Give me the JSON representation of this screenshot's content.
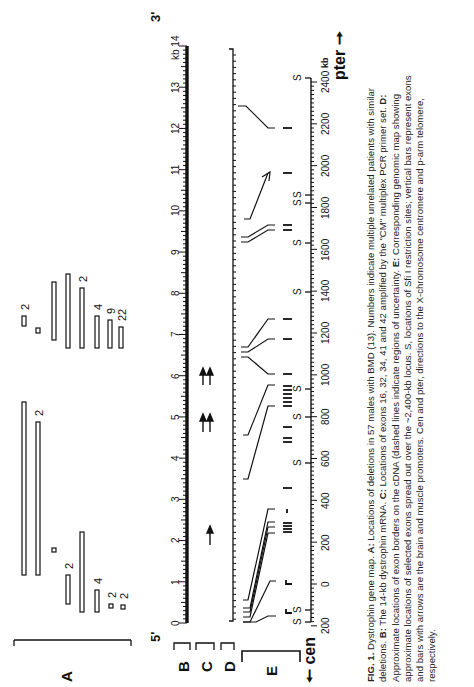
{
  "figure": {
    "label": "FIG. 1.",
    "title": "Dystrophin gene map.",
    "panels": {
      "A": "A",
      "B": "B",
      "C": "C",
      "D": "D",
      "E": "E"
    },
    "five_prime": "5'",
    "three_prime": "3'",
    "kb_unit": "kb",
    "cen_label": "cen",
    "pter_label": "pter",
    "caption_parts": [
      {
        "bold": true,
        "text": "FIG. 1."
      },
      {
        "bold": false,
        "text": " Dystrophin gene map. "
      },
      {
        "bold": true,
        "text": "A:"
      },
      {
        "bold": false,
        "text": " Locations of deletions in 57 males with BMD (13). Numbers indicate multiple unrelated patients with similar deletions. "
      },
      {
        "bold": true,
        "text": "B:"
      },
      {
        "bold": false,
        "text": " The 14-kb dystrophin mRNA. "
      },
      {
        "bold": true,
        "text": "C:"
      },
      {
        "bold": false,
        "text": " Locations of exons 16, 32, 34, 41 and 42 amplified by the \"CM\" multiplex PCR primer set. "
      },
      {
        "bold": true,
        "text": "D:"
      },
      {
        "bold": false,
        "text": " Approximate locations of exon borders on the cDNA (dashed lines indicate regions of uncertainty. "
      },
      {
        "bold": true,
        "text": "E:"
      },
      {
        "bold": false,
        "text": " Corresponding genomic map showing approximate locations of selected exons spread out over the ~2,400-kb locus. S, locations of Sfi I restriction sites; vertical bars represent exons and bars with arrows are the brain and muscle promoters. Cen and pter, directions to the X-chromosome centromere and p-arm telomere, respectively."
      }
    ]
  },
  "chart_data": [
    {
      "type": "table",
      "title": "A: Locations of deletions in 57 males with BMD (cDNA kb coordinates, approx.)",
      "xlabel": "kb",
      "xlim": [
        0,
        14
      ],
      "deletions": [
        {
          "start": 1.2,
          "end": 5.3,
          "count": null
        },
        {
          "start": 1.2,
          "end": 4.8,
          "count": 2
        },
        {
          "start": 2.1,
          "end": 2.2,
          "count": null
        },
        {
          "start": 0.5,
          "end": 1.2,
          "count": 2
        },
        {
          "start": 0.3,
          "end": 2.2,
          "count": null
        },
        {
          "start": 0.3,
          "end": 0.9,
          "count": 4
        },
        {
          "start": 0.3,
          "end": 0.4,
          "count": 2
        },
        {
          "start": 0.3,
          "end": 0.4,
          "count": 2
        },
        {
          "start": 7.2,
          "end": 7.4,
          "count": 2
        },
        {
          "start": 7.0,
          "end": 7.1,
          "count": null
        },
        {
          "start": 6.8,
          "end": 8.3,
          "count": null
        },
        {
          "start": 6.7,
          "end": 8.5,
          "count": null
        },
        {
          "start": 6.7,
          "end": 8.1,
          "count": 2
        },
        {
          "start": 6.7,
          "end": 7.4,
          "count": 4
        },
        {
          "start": 6.7,
          "end": 7.3,
          "count": 9
        },
        {
          "start": 6.7,
          "end": 7.2,
          "count": 22
        }
      ]
    },
    {
      "type": "line",
      "title": "B: The 14-kb dystrophin mRNA",
      "xlabel": "kb",
      "ticks": [
        "0",
        "1",
        "2",
        "3",
        "4",
        "5",
        "6",
        "7",
        "8",
        "9",
        "10",
        "11",
        "12",
        "13",
        "kb 14"
      ],
      "xlim": [
        0,
        14
      ],
      "ends": {
        "left": "5'",
        "right": "3'"
      }
    },
    {
      "type": "scatter",
      "title": "C: Locations of exons amplified by CM multiplex primer set",
      "exons": [
        16,
        32,
        34,
        41,
        42
      ],
      "arrow_positions_kb": [
        2.0,
        4.6,
        4.9,
        6.1,
        6.3
      ]
    },
    {
      "type": "line",
      "title": "E: Genomic map (~2,400-kb locus)",
      "xlabel": "kb",
      "ticks": [
        "200",
        "0",
        "200",
        "400",
        "600",
        "800",
        "1000",
        "1200",
        "1400",
        "1600",
        "1800",
        "2000",
        "2200",
        "2400"
      ],
      "xlim": [
        -200,
        2400
      ],
      "sfi_sites_kb": [
        -200,
        -80,
        590,
        810,
        940,
        1400,
        1640,
        1830,
        1870,
        2450
      ],
      "promoters_kb": [
        -100,
        0
      ],
      "exon_bars_kb": [
        280,
        370,
        390,
        500,
        560,
        620,
        680,
        760,
        900,
        1000,
        1180,
        1280,
        1720,
        1750,
        2000,
        2180
      ],
      "directions": {
        "left": "cen",
        "right": "pter"
      }
    }
  ]
}
